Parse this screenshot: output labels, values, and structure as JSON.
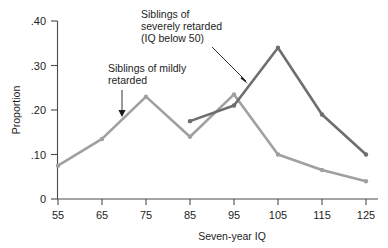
{
  "chart_data": {
    "type": "line",
    "title": "",
    "xlabel": "Seven-year IQ",
    "ylabel": "Proportion",
    "x": [
      55,
      65,
      75,
      85,
      95,
      105,
      115,
      125
    ],
    "xticklabels": [
      "55",
      "65",
      "75",
      "85",
      "95",
      "105",
      "115",
      "125"
    ],
    "yticklabels": [
      "0",
      ".10",
      ".20",
      ".30",
      ".40"
    ],
    "ytickvalues": [
      0,
      0.1,
      0.2,
      0.3,
      0.4
    ],
    "xlim": [
      50,
      130
    ],
    "ylim": [
      0,
      0.42
    ],
    "grid": false,
    "legend_position": "inline-annotations",
    "series": [
      {
        "name": "Siblings of mildly retarded",
        "color": "#a0a0a0",
        "x": [
          55,
          65,
          75,
          85,
          95,
          105,
          115,
          125
        ],
        "values": [
          0.075,
          0.135,
          0.23,
          0.14,
          0.235,
          0.1,
          0.065,
          0.04
        ]
      },
      {
        "name": "Siblings of severely retarded (IQ below 50)",
        "color": "#6e6e6e",
        "x": [
          85,
          95,
          105,
          115,
          125
        ],
        "values": [
          0.175,
          0.21,
          0.34,
          0.19,
          0.1
        ]
      }
    ],
    "annotations": [
      {
        "id": "mildly-annotation",
        "lines": [
          "Siblings of mildly",
          "retarded"
        ],
        "arrow": "down"
      },
      {
        "id": "severely-annotation",
        "lines": [
          "Siblings of",
          "severely retarded",
          "(IQ below 50)"
        ],
        "arrow": "diagonal-down-right"
      }
    ]
  }
}
